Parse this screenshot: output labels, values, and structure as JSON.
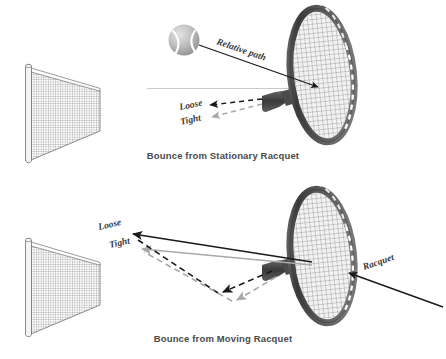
{
  "figure": {
    "title_top": "Bounce from Stationary Racquet",
    "title_bottom": "Bounce from Moving Racquet",
    "background_color": "#ffffff"
  },
  "panels": [
    {
      "id": "stationary",
      "caption": "Bounce from Stationary Racquet",
      "objects": [
        {
          "name": "tennis-net",
          "label": ""
        },
        {
          "name": "tennis-ball",
          "label": ""
        },
        {
          "name": "tennis-racquet",
          "label": ""
        }
      ],
      "annotations": [
        {
          "name": "relative-path-label",
          "text": "Relative path",
          "arrow": "solid",
          "color": "#1a1a1a"
        },
        {
          "name": "loose-label",
          "text": "Loose",
          "arrow": "dashed",
          "color": "#1a1a1a"
        },
        {
          "name": "tight-label",
          "text": "Tight",
          "arrow": "dashed",
          "color": "#a8a8a8"
        }
      ]
    },
    {
      "id": "moving",
      "caption": "Bounce from Moving Racquet",
      "objects": [
        {
          "name": "tennis-net",
          "label": ""
        },
        {
          "name": "tennis-racquet",
          "label": ""
        }
      ],
      "annotations": [
        {
          "name": "loose-label",
          "text": "Loose",
          "arrow": "solid",
          "color": "#1a1a1a"
        },
        {
          "name": "tight-label",
          "text": "Tight",
          "arrow": "solid",
          "color": "#a8a8a8"
        },
        {
          "name": "racquet-label",
          "text": "Racquet",
          "arrow": "solid",
          "color": "#1a1a1a"
        }
      ]
    }
  ],
  "colors": {
    "ink": "#1a1a1a",
    "caption": "#4a4a4a",
    "gray_arrow": "#a8a8a8",
    "racquet_frame": "#4f4f4f",
    "racquet_frame_light": "#8c8c8c",
    "string_gray": "#9a9a9a",
    "ball_gray": "#b5b5b5",
    "net_gray": "#8f8f8f",
    "reference_line": "#c9c9c9"
  }
}
